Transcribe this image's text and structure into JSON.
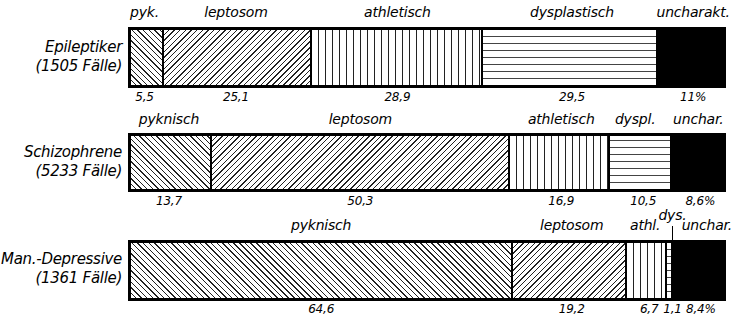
{
  "chart_data": {
    "type": "bar",
    "subtype": "stacked-100-horizontal",
    "title": "",
    "xlabel": "",
    "ylabel": "",
    "unit": "%",
    "categories": [
      "Epileptiker (1505 Fälle)",
      "Schizophrene (5233 Fälle)",
      "Man.-Depressive (1361 Fälle)"
    ],
    "series": [
      {
        "name": "pyknisch",
        "pattern": "diagonal-forward",
        "values": [
          5.5,
          13.7,
          64.6
        ]
      },
      {
        "name": "leptosom",
        "pattern": "diagonal-back",
        "values": [
          25.1,
          50.3,
          19.2
        ]
      },
      {
        "name": "athletisch",
        "pattern": "vertical-lines",
        "values": [
          28.9,
          16.9,
          6.7
        ]
      },
      {
        "name": "dysplastisch",
        "pattern": "horizontal-lines",
        "values": [
          29.5,
          10.5,
          1.1
        ]
      },
      {
        "name": "uncharakteristisch",
        "pattern": "solid-black",
        "values": [
          11.0,
          8.6,
          8.4
        ]
      }
    ],
    "legend": "inline segment labels above bars",
    "grid": false
  },
  "rows": [
    {
      "label_line1": "Epileptiker",
      "label_line2": "(1505 Fälle)",
      "segments": [
        {
          "top": "pyk.",
          "bottom": "5,5",
          "value": 5.5,
          "pattern": "p-back"
        },
        {
          "top": "leptosom",
          "bottom": "25,1",
          "value": 25.1,
          "pattern": "p-fwd"
        },
        {
          "top": "athletisch",
          "bottom": "28,9",
          "value": 28.9,
          "pattern": "p-vert"
        },
        {
          "top": "dysplastisch",
          "bottom": "29,5",
          "value": 29.5,
          "pattern": "p-horz"
        },
        {
          "top": "uncharakt.",
          "bottom": "11%",
          "value": 11.0,
          "pattern": "p-solid"
        }
      ]
    },
    {
      "label_line1": "Schizophrene",
      "label_line2": "(5233 Fälle)",
      "segments": [
        {
          "top": "pyknisch",
          "bottom": "13,7",
          "value": 13.7,
          "pattern": "p-back"
        },
        {
          "top": "leptosom",
          "bottom": "50,3",
          "value": 50.3,
          "pattern": "p-fwd"
        },
        {
          "top": "athletisch",
          "bottom": "16,9",
          "value": 16.9,
          "pattern": "p-vert"
        },
        {
          "top": "dyspl.",
          "bottom": "10,5",
          "value": 10.5,
          "pattern": "p-horz"
        },
        {
          "top": "unchar.",
          "bottom": "8,6%",
          "value": 8.6,
          "pattern": "p-solid"
        }
      ]
    },
    {
      "label_line1": "Man.-Depressive",
      "label_line2": "(1361 Fälle)",
      "segments": [
        {
          "top": "pyknisch",
          "bottom": "64,6",
          "value": 64.6,
          "pattern": "p-back"
        },
        {
          "top": "leptosom",
          "bottom": "19,2",
          "value": 19.2,
          "pattern": "p-fwd"
        },
        {
          "top": "athl.",
          "bottom": "6,7",
          "value": 6.7,
          "pattern": "p-vert"
        },
        {
          "top": "dys.",
          "bottom": "1,1",
          "value": 1.1,
          "pattern": "p-horz"
        },
        {
          "top": "unchar.",
          "bottom": "8,4%",
          "value": 8.4,
          "pattern": "p-solid"
        }
      ]
    }
  ]
}
